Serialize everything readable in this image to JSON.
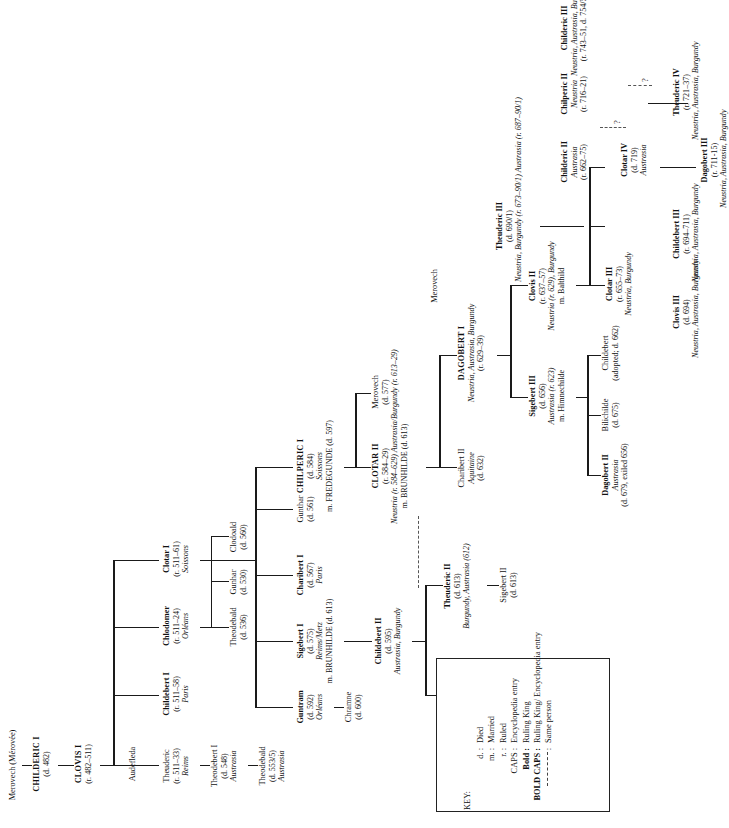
{
  "key": {
    "title": "KEY:",
    "rows": [
      {
        "symbol": "d. :",
        "meaning": "Died",
        "bold": false
      },
      {
        "symbol": "m. :",
        "meaning": "Married",
        "bold": false
      },
      {
        "symbol": "r. :",
        "meaning": "Ruled",
        "bold": false
      },
      {
        "symbol": "CAPS :",
        "meaning": "Encyclopedia entry",
        "bold": false
      },
      {
        "symbol": "Bold :",
        "meaning": "Ruling King",
        "bold": true
      },
      {
        "symbol": "BOLD CAPS :",
        "meaning": "Ruling King/ Encyclopedia entry",
        "bold": true
      },
      {
        "symbol": "dash",
        "meaning": "Same person",
        "bold": false
      }
    ]
  },
  "nodes": {
    "merovech_ancestor": {
      "name": "Merovech (Mérovée)",
      "style": "plain"
    },
    "childeric1": {
      "name": "CHILDERIC I",
      "dates": "(d. 482)",
      "style": "bold-caps"
    },
    "clovis1": {
      "name": "CLOVIS I",
      "dates": "(r. 482–511)",
      "style": "bold-caps"
    },
    "audefleda": {
      "name": "Audefleda",
      "style": "plain"
    },
    "theuderic": {
      "name": "Theuderic",
      "dates": "(r. 511–33)",
      "region": "Reims",
      "style": "plain"
    },
    "theodebert1": {
      "name": "Theodebert I",
      "dates": "(d. 548)",
      "region": "Austrasia",
      "style": "plain"
    },
    "theodebald": {
      "name": "Theodebald",
      "dates": "(d. 553/5)",
      "region": "Austrasia",
      "style": "plain"
    },
    "childebert1": {
      "name": "Childebert I",
      "dates": "(r. 511–58)",
      "region": "Paris",
      "style": "bold"
    },
    "chlodomer": {
      "name": "Chlodomer",
      "dates": "(r. 511–24)",
      "region": "Orléans",
      "style": "bold"
    },
    "clotar1": {
      "name": "Clotar I",
      "dates": "(r. 511–61)",
      "region": "Soissons",
      "style": "bold"
    },
    "theodebald2": {
      "name": "Theodebald",
      "dates": "(d. 536)",
      "style": "plain"
    },
    "gunhar": {
      "name": "Gunhar",
      "dates": "(d. 530)",
      "style": "plain"
    },
    "clodoald": {
      "name": "Clodoald",
      "dates": "(d. 560)",
      "style": "plain"
    },
    "guntram": {
      "name": "Guntram",
      "dates": "(d. 592)",
      "region": "Orléans",
      "style": "bold"
    },
    "chramne": {
      "name": "Chramne",
      "dates": "(d. 600)",
      "style": "plain"
    },
    "sigebert1": {
      "name": "Sigebert I",
      "dates": "(d. 575)",
      "region": "Reims/Metz",
      "spouse": "m. BRUNHILDE (d. 613)",
      "style": "bold"
    },
    "charibert1": {
      "name": "Charibert I",
      "dates": "(d. 567)",
      "region": "Paris",
      "style": "bold"
    },
    "gunthar": {
      "name": "Gunthar",
      "dates": "(d. 561)",
      "style": "plain"
    },
    "chilperic1": {
      "name": "CHILPERIC I",
      "dates": "(d. 584)",
      "region": "Soissons",
      "spouse": "m. FREDEGUNDE (d. 597)",
      "style": "bold-caps"
    },
    "childebert2": {
      "name": "Childebert II",
      "dates": "(d. 595)",
      "region": "Austrasia, Burgundy",
      "style": "bold"
    },
    "merovech": {
      "name": "Merovech",
      "dates": "(d. 577)",
      "style": "plain"
    },
    "clotar2": {
      "name": "CLOTAR II",
      "dates": "(r. 584–29)",
      "region": "Neustria (r. 584–629) Austrasia/Burgundy (r. 613–29)",
      "spouse": "m. BRUNHILDE (d. 613)",
      "style": "bold-caps"
    },
    "theodebert2": {
      "name": "Theodebert II",
      "dates": "(d. 612)",
      "region": "Austrasia",
      "style": "bold"
    },
    "theuderic2": {
      "name": "Theuderic II",
      "dates": "(d. 613)",
      "region": "Burgundy, Austrasia (612)",
      "style": "bold"
    },
    "sigebert2": {
      "name": "Sigebert II",
      "dates": "(d. 613)",
      "style": "plain"
    },
    "charibert2": {
      "name": "Charibert II",
      "region": "Aquitaine",
      "dates": "(d. 632)",
      "style": "plain"
    },
    "dagobert1": {
      "name": "DAGOBERT I",
      "region": "Neustria, Austrasia, Burgundy",
      "dates": "(r. 629–39)",
      "style": "bold-caps"
    },
    "merovech2": {
      "name": "Merovech",
      "style": "plain"
    },
    "sigebert3": {
      "name": "Sigebert III",
      "dates": "(d. 656)",
      "region": "Austrasia (r. 623)",
      "spouse": "m. Himnechilde",
      "style": "bold"
    },
    "clovis2": {
      "name": "Clovis II",
      "dates": "(r. 637–57)",
      "region": "Neustria (r. 629), Burgundy",
      "spouse": "m. Balthild",
      "style": "bold"
    },
    "dagobert2": {
      "name": "Dagobert II",
      "region": "Austrasia",
      "dates": "(d. 679, exiled 656)",
      "style": "bold"
    },
    "bilichilde": {
      "name": "Bilichilde",
      "dates": "(d. 675)",
      "style": "plain"
    },
    "childebert_adopted": {
      "name": "Childebert",
      "dates": "(adopted; d. 662)",
      "style": "plain"
    },
    "clotar3": {
      "name": "Clotar III",
      "dates": "(r. 655–73)",
      "region": "Neustria, Burgundy",
      "style": "bold"
    },
    "theuderic3": {
      "name": "Theuderic III",
      "dates": "(d. 690/1)",
      "region": "Neustria, Burgundy (r. 673–90/1) Austrasia (r. 687–90/1)",
      "style": "bold"
    },
    "childeric2": {
      "name": "Childeric II",
      "region": "Austrasia",
      "dates": "(r. 662–75)",
      "style": "bold"
    },
    "clovis3": {
      "name": "Clovis III",
      "dates": "(d. 694)",
      "region": "Neustria, Austrasia, Burgundy",
      "style": "bold"
    },
    "childebert3": {
      "name": "Childebert III",
      "dates": "(r. 694–711)",
      "region": "Neustria, Austrasia, Burgundy",
      "style": "bold"
    },
    "clotar4": {
      "name": "Clotar IV",
      "dates": "(d. 719)",
      "region": "Austrasia",
      "style": "bold"
    },
    "chilperic2": {
      "name": "Chilperic II",
      "region": "Neustria",
      "dates": "(r. 716–21)",
      "style": "bold"
    },
    "dagobert3": {
      "name": "Dagobert III",
      "dates": "(r. 711-15)",
      "region": "Neustria, Austrasia, Burgundy",
      "style": "bold"
    },
    "theuderic4": {
      "name": "Theuderic IV",
      "dates": "(r. 721–37)",
      "region": "Neustria, Austrasia, Burgundy",
      "style": "bold"
    },
    "childeric3": {
      "name": "Childeric III",
      "region": "Neustria, Austrasia, Burgundy",
      "dates": "(r. 743–51, d. 754/5)",
      "style": "bold"
    },
    "qmark1": "?",
    "qmark2": "?",
    "qmark3": "?"
  }
}
